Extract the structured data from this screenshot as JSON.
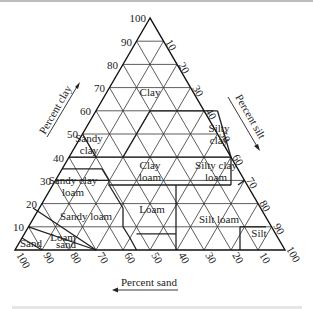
{
  "axes": {
    "clay": {
      "label": "Percent clay",
      "ticks": [
        "10",
        "20",
        "30",
        "40",
        "50",
        "60",
        "70",
        "80",
        "90",
        "100"
      ]
    },
    "silt": {
      "label": "Percent silt",
      "ticks": [
        "10",
        "20",
        "30",
        "40",
        "50",
        "60",
        "70",
        "80",
        "90",
        "100"
      ]
    },
    "sand": {
      "label": "Percent sand",
      "ticks": [
        "100",
        "90",
        "80",
        "70",
        "60",
        "50",
        "40",
        "30",
        "20",
        "10"
      ]
    }
  },
  "regions": {
    "clay": "Clay",
    "silty_clay_1": "Silty",
    "silty_clay_2": "clay",
    "sandy_clay_1": "Sandy",
    "sandy_clay_2": "clay",
    "clay_loam_1": "Clay",
    "clay_loam_2": "loam",
    "silty_clay_loam_1": "Silty clay",
    "silty_clay_loam_2": "loam",
    "sandy_clay_loam_1": "Sandy clay",
    "sandy_clay_loam_2": "loam",
    "loam": "Loam",
    "sandy_loam": "Sandy loam",
    "silt_loam": "Silt loam",
    "silt": "Silt",
    "loamy_sand_1": "Loam",
    "loamy_sand_2": "sand",
    "sand": "Sand"
  }
}
